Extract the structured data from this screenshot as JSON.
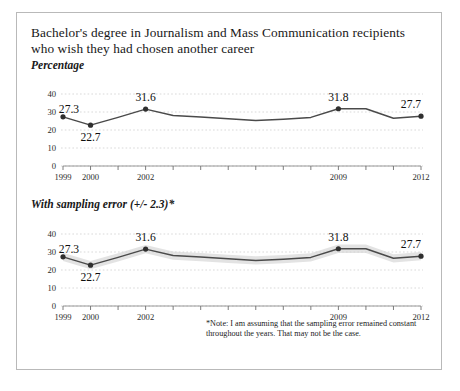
{
  "figure": {
    "title": "Bachelor's degree in Journalism and Mass Communication recipients who wish they had chosen another career",
    "panel1_subtitle": "Percentage",
    "panel2_subtitle": "With sampling error (+/- 2.3)*",
    "note": "*Note: I am assuming that the sampling error remained constant throughout the years. That may not be the case."
  },
  "chart_data": [
    {
      "type": "line",
      "title": "Percentage",
      "xlabel": "",
      "ylabel": "Percentage",
      "x": [
        1999,
        2000,
        2001,
        2002,
        2003,
        2004,
        2005,
        2006,
        2007,
        2008,
        2009,
        2010,
        2011,
        2012
      ],
      "categories": [
        "1999",
        "2000",
        "2001",
        "2002",
        "2003",
        "2004",
        "2005",
        "2006",
        "2007",
        "2008",
        "2009",
        "2010",
        "2011",
        "2012"
      ],
      "tick_labels_shown": [
        "1999",
        "2000",
        "",
        "2002",
        "",
        "",
        "",
        "",
        "",
        "",
        "2009",
        "",
        "",
        "2012"
      ],
      "values": [
        27.3,
        22.7,
        27.0,
        31.6,
        28.0,
        27.2,
        26.2,
        25.3,
        26.0,
        27.0,
        31.8,
        31.8,
        26.5,
        27.7
      ],
      "point_labels": {
        "1999": "27.3",
        "2000": "22.7",
        "2002": "31.6",
        "2009": "31.8",
        "2012": "27.7"
      },
      "labeled_points": [
        {
          "x": 1999,
          "y": 27.3,
          "label": "27.3",
          "pos": "above-left"
        },
        {
          "x": 2000,
          "y": 22.7,
          "label": "22.7",
          "pos": "below"
        },
        {
          "x": 2002,
          "y": 31.6,
          "label": "31.6",
          "pos": "above"
        },
        {
          "x": 2009,
          "y": 31.8,
          "label": "31.8",
          "pos": "above"
        },
        {
          "x": 2012,
          "y": 27.7,
          "label": "27.7",
          "pos": "above"
        }
      ],
      "marker_points": [
        1999,
        2000,
        2002,
        2009,
        2012
      ],
      "ylim": [
        0,
        40
      ],
      "yticks": [
        0,
        10,
        20,
        30,
        40
      ],
      "ytick_labels": [
        "0",
        "10",
        "20",
        "30",
        "40"
      ],
      "grid": true,
      "legend": "none"
    },
    {
      "type": "line",
      "title": "With sampling error (+/- 2.3)*",
      "xlabel": "",
      "ylabel": "Percentage",
      "x": [
        1999,
        2000,
        2001,
        2002,
        2003,
        2004,
        2005,
        2006,
        2007,
        2008,
        2009,
        2010,
        2011,
        2012
      ],
      "categories": [
        "1999",
        "2000",
        "2001",
        "2002",
        "2003",
        "2004",
        "2005",
        "2006",
        "2007",
        "2008",
        "2009",
        "2010",
        "2011",
        "2012"
      ],
      "tick_labels_shown": [
        "1999",
        "2000",
        "",
        "2002",
        "",
        "",
        "",
        "",
        "",
        "",
        "2009",
        "",
        "",
        "2012"
      ],
      "values": [
        27.3,
        22.7,
        27.0,
        31.6,
        28.0,
        27.2,
        26.2,
        25.3,
        26.0,
        27.0,
        31.8,
        31.8,
        26.5,
        27.7
      ],
      "error": 2.3,
      "error_label": "+/- 2.3",
      "point_labels": {
        "1999": "27.3",
        "2000": "22.7",
        "2002": "31.6",
        "2009": "31.8",
        "2012": "27.7"
      },
      "labeled_points": [
        {
          "x": 1999,
          "y": 27.3,
          "label": "27.3",
          "pos": "above-left"
        },
        {
          "x": 2000,
          "y": 22.7,
          "label": "22.7",
          "pos": "below"
        },
        {
          "x": 2002,
          "y": 31.6,
          "label": "31.6",
          "pos": "above"
        },
        {
          "x": 2009,
          "y": 31.8,
          "label": "31.8",
          "pos": "above"
        },
        {
          "x": 2012,
          "y": 27.7,
          "label": "27.7",
          "pos": "above"
        }
      ],
      "marker_points": [
        1999,
        2000,
        2002,
        2009,
        2012
      ],
      "ylim": [
        0,
        40
      ],
      "yticks": [
        0,
        10,
        20,
        30,
        40
      ],
      "ytick_labels": [
        "0",
        "10",
        "20",
        "30",
        "40"
      ],
      "grid": true,
      "legend": "none",
      "note": "*Note: I am assuming that the sampling error remained constant throughout the years. That may not be the case."
    }
  ],
  "colors": {
    "line": "#4a4a4a",
    "band": "#d4d4d4",
    "grid": "#cfcfcf",
    "axis": "#8d8d8d",
    "text": "#1b1b1b",
    "border": "#b9b9b9"
  }
}
